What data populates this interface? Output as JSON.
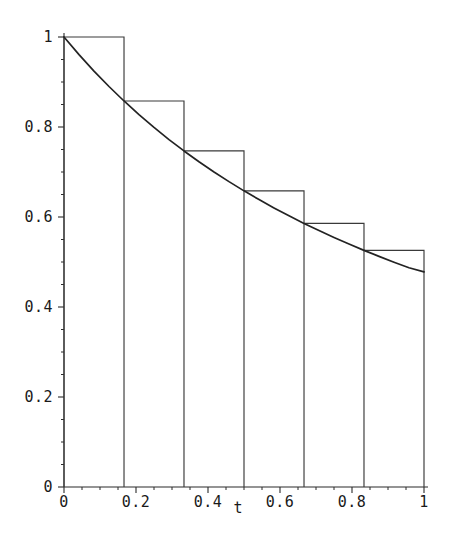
{
  "chart_data": {
    "type": "area",
    "title": "",
    "subtitle": "",
    "xlabel": "t",
    "ylabel": "",
    "xlim": [
      0,
      1
    ],
    "ylim": [
      0,
      1
    ],
    "grid": false,
    "legend": null,
    "x_ticks": [
      {
        "value": 0,
        "label": "0"
      },
      {
        "value": 0.2,
        "label": "0.2"
      },
      {
        "value": 0.4,
        "label": "0.4"
      },
      {
        "value": 0.6,
        "label": "0.6"
      },
      {
        "value": 0.8,
        "label": "0.8"
      },
      {
        "value": 1,
        "label": "1"
      }
    ],
    "y_ticks": [
      {
        "value": 0,
        "label": "0"
      },
      {
        "value": 0.2,
        "label": "0.2"
      },
      {
        "value": 0.4,
        "label": "0.4"
      },
      {
        "value": 0.6,
        "label": "0.6"
      },
      {
        "value": 0.8,
        "label": "0.8"
      },
      {
        "value": 1,
        "label": "1"
      }
    ],
    "x_minor_tick_step": 0.05,
    "y_minor_tick_step": 0.05,
    "series": [
      {
        "name": "decay-curve",
        "type": "line",
        "color": "#232323",
        "x": [
          0,
          0.0417,
          0.0833,
          0.125,
          0.1667,
          0.2083,
          0.25,
          0.2917,
          0.3333,
          0.375,
          0.4167,
          0.4583,
          0.5,
          0.5417,
          0.5833,
          0.625,
          0.6667,
          0.7083,
          0.75,
          0.7917,
          0.8333,
          0.875,
          0.9167,
          0.9583,
          1
        ],
        "y": [
          1.0,
          0.9609,
          0.9243,
          0.89,
          0.8578,
          0.8275,
          0.799,
          0.7721,
          0.7468,
          0.7228,
          0.7001,
          0.6786,
          0.6581,
          0.6387,
          0.6202,
          0.6026,
          0.5858,
          0.5698,
          0.5545,
          0.5399,
          0.5259,
          0.5125,
          0.4996,
          0.4873,
          0.478
        ]
      },
      {
        "name": "step-approximation",
        "type": "step",
        "color": "#3a3a3a",
        "step_count": 6,
        "bin_edges": [
          0,
          0.1667,
          0.3333,
          0.5,
          0.6667,
          0.8333,
          1
        ],
        "values": [
          1.0,
          0.8578,
          0.7468,
          0.6581,
          0.5858,
          0.5259
        ]
      }
    ],
    "annotations": []
  },
  "axis": {
    "x_name": "t"
  }
}
